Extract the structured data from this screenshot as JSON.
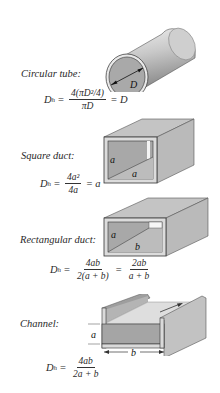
{
  "figure": {
    "sections": [
      {
        "name": "circular-tube",
        "label": "Circular tube:",
        "dimension_labels": [
          "D"
        ],
        "equation": {
          "lhs": "D",
          "lhs_sub": "h",
          "eq1": "=",
          "num": "4(πD²/4)",
          "den": "πD",
          "eq2": "=",
          "rhs": "D"
        }
      },
      {
        "name": "square-duct",
        "label": "Square duct:",
        "dimension_labels": [
          "a",
          "a"
        ],
        "equation": {
          "lhs": "D",
          "lhs_sub": "h",
          "eq1": "=",
          "num": "4a²",
          "den": "4a",
          "eq2": "=",
          "rhs": "a"
        }
      },
      {
        "name": "rectangular-duct",
        "label": "Rectangular duct:",
        "dimension_labels": [
          "a",
          "b"
        ],
        "equation": {
          "lhs": "D",
          "lhs_sub": "h",
          "eq1": "=",
          "num": "4ab",
          "den": "2(a + b)",
          "eq2": "=",
          "num2": "2ab",
          "den2": "a + b"
        }
      },
      {
        "name": "channel",
        "label": "Channel:",
        "dimension_labels": [
          "a",
          "b"
        ],
        "equation": {
          "lhs": "D",
          "lhs_sub": "h",
          "eq1": "=",
          "num": "4ab",
          "den": "2a + b"
        }
      }
    ],
    "colors": {
      "shape_fill_light": "#e6e6e6",
      "shape_fill_mid": "#bdbdbd",
      "shape_fill_dark": "#9a9a9a",
      "outline": "#333333"
    }
  }
}
